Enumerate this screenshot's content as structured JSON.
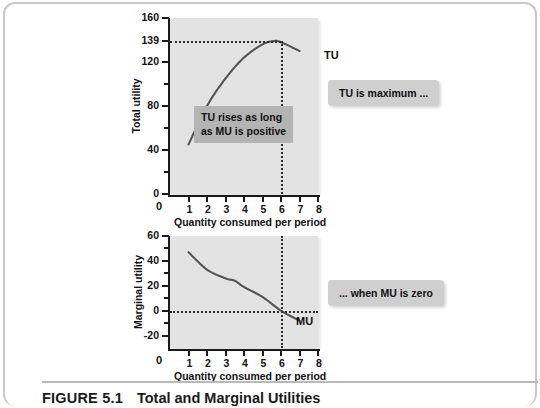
{
  "figure": {
    "number": "FIGURE 5.1",
    "title": "Total and Marginal Utilities"
  },
  "callouts": {
    "top": "TU is maximum ...",
    "bottom": "... when MU is zero"
  },
  "notes": {
    "inner_line1": "TU rises as long",
    "inner_line2": "as MU is positive"
  },
  "chart_data": [
    {
      "type": "line",
      "id": "total-utility",
      "title": "",
      "xlabel": "Quantity consumed per period",
      "ylabel": "Total utility",
      "xlim": [
        0,
        8
      ],
      "ylim": [
        0,
        160
      ],
      "grid": false,
      "legend_position": "inline-right",
      "xticks": [
        0,
        1,
        2,
        3,
        4,
        5,
        6,
        7,
        8
      ],
      "xtick_labels": [
        "0",
        "1",
        "2",
        "3",
        "4",
        "5",
        "6",
        "7",
        "8"
      ],
      "yticks": [
        0,
        20,
        40,
        60,
        80,
        100,
        120,
        139,
        160
      ],
      "ytick_labels_major": [
        "0",
        "40",
        "80",
        "120",
        "139",
        "160"
      ],
      "ytick_major_values": [
        0,
        40,
        80,
        120,
        139,
        160
      ],
      "ytick_minor_values": [
        20,
        60,
        100
      ],
      "origin_label": "0",
      "series": [
        {
          "name": "TU",
          "label": "TU",
          "color": "#555555",
          "x": [
            1,
            2,
            3,
            4,
            5,
            5.6,
            6,
            7
          ],
          "values": [
            45,
            80,
            105,
            124,
            136,
            139,
            138,
            130
          ]
        }
      ],
      "annotations": [
        {
          "name": "max-utility-hline",
          "type": "hline",
          "y": 139,
          "style": "dotted",
          "from_x": 0,
          "to_x": 6
        },
        {
          "name": "max-utility-vline",
          "type": "vline",
          "x": 6,
          "style": "dotted",
          "from_y": 0,
          "to_y": 139
        }
      ]
    },
    {
      "type": "line",
      "id": "marginal-utility",
      "title": "",
      "xlabel": "Quantity consumed per period",
      "ylabel": "Marginal utility",
      "xlim": [
        0,
        8
      ],
      "ylim": [
        -30,
        60
      ],
      "grid": false,
      "legend_position": "inline-right",
      "xticks": [
        0,
        1,
        2,
        3,
        4,
        5,
        6,
        7,
        8
      ],
      "xtick_labels": [
        "0",
        "1",
        "2",
        "3",
        "4",
        "5",
        "6",
        "7",
        "8"
      ],
      "ytick_labels_major": [
        "-20",
        "0",
        "20",
        "40",
        "60"
      ],
      "ytick_major_values": [
        -20,
        0,
        20,
        40,
        60
      ],
      "ytick_minor_values": [
        -10,
        10,
        30,
        50
      ],
      "origin_label": "0",
      "series": [
        {
          "name": "MU",
          "label": "MU",
          "color": "#555555",
          "x": [
            1,
            2,
            3,
            3.5,
            4,
            5,
            6,
            7
          ],
          "values": [
            47,
            33,
            26,
            24,
            19,
            11,
            0,
            -8
          ]
        }
      ],
      "annotations": [
        {
          "name": "zero-mu-hline",
          "type": "hline",
          "y": 0,
          "style": "dotted",
          "from_x": 0,
          "to_x": 8
        },
        {
          "name": "zero-mu-vline",
          "type": "vline",
          "x": 6,
          "style": "dotted",
          "from_y": -30,
          "to_y": 60
        }
      ]
    }
  ]
}
